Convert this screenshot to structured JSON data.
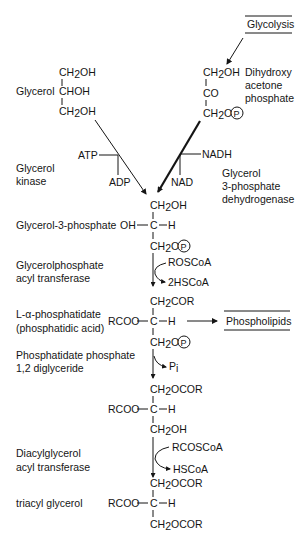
{
  "diagram": {
    "boxed_labels": {
      "glycolysis": "Glycolysis",
      "phospholipids": "Phospholipids"
    },
    "glycerol": {
      "label": "Glycerol",
      "lines": [
        "CH2OH",
        "CHOH",
        "CH2OH"
      ]
    },
    "dhap": {
      "label_lines": [
        "Dihydroxy",
        "acetone",
        "phosphate"
      ],
      "lines": [
        "CH2OH",
        "CO",
        "CH2O"
      ]
    },
    "glycerol_kinase": {
      "label_lines": [
        "Glycerol",
        "kinase"
      ],
      "in": "ATP",
      "out": "ADP"
    },
    "g3p_dehydrogenase": {
      "label_lines": [
        "Glycerol",
        "3-phosphate",
        "dehydrogenase"
      ],
      "in": "NADH",
      "out": "NAD"
    },
    "glycerol_3_phosphate": {
      "label": "Glycerol-3-phosphate",
      "top": "CH2OH",
      "left": "OH",
      "center": "C",
      "right": "H",
      "bottom": "CH2O"
    },
    "glycerolphosphate_acyl_transferase": {
      "label_lines": [
        "Glycerolphosphate",
        "acyl transferase"
      ],
      "in": "ROSCoA",
      "out": "2HSCoA"
    },
    "phosphatidic_acid": {
      "label_lines": [
        "L-α-phosphatidate",
        "(phosphatidic acid)"
      ],
      "top": "CH2COR",
      "left": "RCOO",
      "center": "C",
      "right": "H",
      "bottom": "CH2O"
    },
    "phosphatidate_phosphatase": {
      "label_lines": [
        "Phosphatidate phosphate",
        "1,2 diglyceride"
      ],
      "out": "Pi"
    },
    "diglyceride": {
      "top": "CH2OCOR",
      "left": "RCOO",
      "center": "C",
      "right": "H",
      "bottom": "CH2OH"
    },
    "diacylglycerol_acyl_transferase": {
      "label_lines": [
        "Diacylglycerol",
        "acyl transferase"
      ],
      "in": "RCOSCoA",
      "out": "HSCoA"
    },
    "triacylglycerol": {
      "label": "triacyl glycerol",
      "top": "CH2OCOR",
      "left": "RCOO",
      "center": "C",
      "right": "H",
      "bottom": "CH2OCOR"
    },
    "phosphate_symbol": "P"
  }
}
